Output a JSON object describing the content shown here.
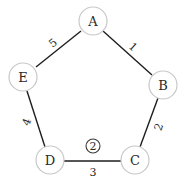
{
  "diagram": {
    "type": "weighted-cycle-graph",
    "nodes": [
      {
        "id": "A",
        "label": "A",
        "x": 93,
        "y": 21
      },
      {
        "id": "B",
        "label": "B",
        "x": 163,
        "y": 85
      },
      {
        "id": "C",
        "label": "C",
        "x": 135,
        "y": 160
      },
      {
        "id": "D",
        "label": "D",
        "x": 50,
        "y": 160
      },
      {
        "id": "E",
        "label": "E",
        "x": 23,
        "y": 77
      }
    ],
    "edges": [
      {
        "from": "A",
        "to": "B",
        "label": "1"
      },
      {
        "from": "B",
        "to": "C",
        "label": "2"
      },
      {
        "from": "C",
        "to": "D",
        "label": "3"
      },
      {
        "from": "D",
        "to": "E",
        "label": "4"
      },
      {
        "from": "E",
        "to": "A",
        "label": "5"
      }
    ],
    "badge": {
      "label": "2",
      "near_edge": "C-D"
    },
    "colors": {
      "node_stroke": "#c8c8c8",
      "node_fill": "#ffffff",
      "edge": "#1e1e1e",
      "text": "#2a2a2a"
    }
  }
}
